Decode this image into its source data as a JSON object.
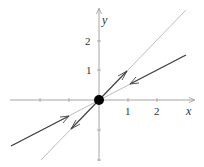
{
  "diagram": {
    "type": "phase-portrait",
    "axes": {
      "x_label": "x",
      "y_label": "y",
      "x_ticks": [
        {
          "value": -2,
          "label": ""
        },
        {
          "value": -1,
          "label": ""
        },
        {
          "value": 1,
          "label": "1"
        },
        {
          "value": 2,
          "label": "2"
        }
      ],
      "y_ticks": [
        {
          "value": 2,
          "label": "2"
        },
        {
          "value": 1,
          "label": "1"
        },
        {
          "value": -1,
          "label": ""
        },
        {
          "value": -2,
          "label": ""
        }
      ]
    },
    "equilibrium": {
      "x": 0,
      "y": 0,
      "label": "saddle point"
    },
    "trajectories": [
      {
        "name": "unstable-manifold",
        "slope": 1,
        "direction": "outward"
      },
      {
        "name": "stable-manifold",
        "slope": 0.5,
        "direction": "inward"
      }
    ],
    "colors": {
      "axis": "#9a9a9a",
      "light_line": "#b5b5b5",
      "dark_line": "#444444",
      "point": "#000000"
    }
  }
}
